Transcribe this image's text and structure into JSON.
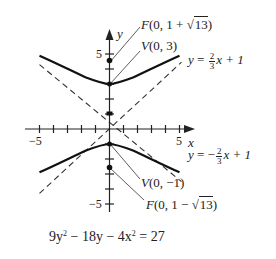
{
  "diagram": {
    "type": "hyperbola-graph",
    "equation": {
      "pre": "9y",
      "sup1": "2",
      "mid": " − 18y − 4x",
      "sup2": "2",
      "post": " = 27"
    },
    "axes": {
      "x_label": "x",
      "y_label": "y",
      "x_ticks": [
        -5,
        -4,
        -3,
        -2,
        -1,
        1,
        2,
        3,
        4,
        5
      ],
      "y_ticks": [
        -5,
        -4,
        -3,
        -2,
        -1,
        1,
        2,
        3,
        4,
        5
      ],
      "x_tick_label_neg": "−5",
      "x_tick_label_pos": "5",
      "y_tick_label_pos": "5",
      "y_tick_label_neg": "−5"
    },
    "points": {
      "focus_upper": {
        "prefix": "F",
        "text_a": "(0, 1 + ",
        "sqrt": "13",
        "text_b": ")"
      },
      "vertex_upper": {
        "prefix": "V",
        "text": "(0, 3)"
      },
      "vertex_lower": {
        "prefix": "V",
        "text": "(0, −1)"
      },
      "focus_lower": {
        "prefix": "F",
        "text_a": "(0, 1 − ",
        "sqrt": "13",
        "text_b": ")"
      }
    },
    "asymptotes": {
      "upper": {
        "lhs": "y",
        "eq": " = ",
        "num": "2",
        "den": "3",
        "rhs": "x + 1"
      },
      "lower": {
        "lhs": "y",
        "eq": " = −",
        "num": "2",
        "den": "3",
        "rhs": "x + 1"
      }
    },
    "colors": {
      "ink": "#222222",
      "background": "#ffffff"
    }
  }
}
